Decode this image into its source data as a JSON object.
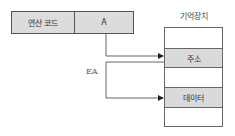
{
  "instruction": {
    "opcode_label": "연산 코드",
    "address_field": "A"
  },
  "memory": {
    "title": "기억장치",
    "rows": [
      {
        "label": "",
        "highlight": false
      },
      {
        "label": "주소",
        "highlight": true
      },
      {
        "label": "",
        "highlight": false
      },
      {
        "label": "데이터",
        "highlight": true
      },
      {
        "label": "",
        "highlight": false
      }
    ]
  },
  "annotations": {
    "effective_address": "EA"
  },
  "colors": {
    "cell_fill": "#dadada",
    "line": "#555555"
  }
}
